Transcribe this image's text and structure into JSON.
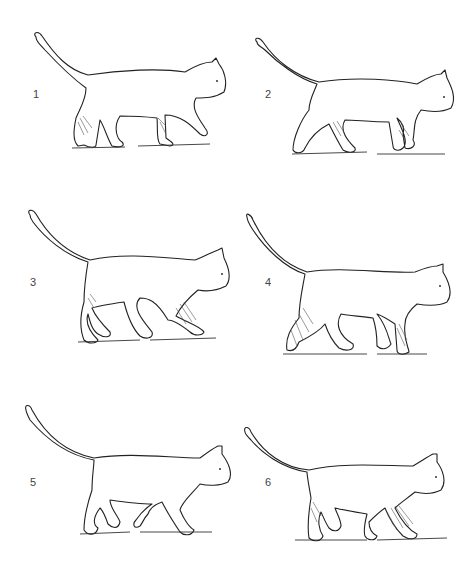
{
  "figure": {
    "background": "#ffffff",
    "line_color": "#222222",
    "panels": [
      {
        "label": "1",
        "x": 0,
        "y": 0,
        "num_x": 33,
        "num_y": 88,
        "shaded": [
          "left-hind",
          "left-fore"
        ]
      },
      {
        "label": "2",
        "x": 237,
        "y": 0,
        "num_x": 28,
        "num_y": 88,
        "shaded": [
          "left-hind",
          "left-fore"
        ]
      },
      {
        "label": "3",
        "x": 0,
        "y": 190,
        "num_x": 30,
        "num_y": 86,
        "shaded": [
          "left-hind",
          "left-fore"
        ]
      },
      {
        "label": "4",
        "x": 237,
        "y": 190,
        "num_x": 28,
        "num_y": 86,
        "shaded": [
          "left-hind",
          "left-fore"
        ]
      },
      {
        "label": "5",
        "x": 0,
        "y": 390,
        "num_x": 30,
        "num_y": 86,
        "shaded": []
      },
      {
        "label": "6",
        "x": 237,
        "y": 390,
        "num_x": 28,
        "num_y": 86,
        "shaded": [
          "left-hind",
          "left-fore"
        ]
      }
    ]
  }
}
